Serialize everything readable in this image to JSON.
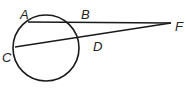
{
  "figure": {
    "type": "secant-secant geometry figure",
    "circle": {
      "cx": 46,
      "cy": 48,
      "r": 33
    },
    "points": {
      "A": {
        "label": "A",
        "x": 28,
        "y": 21
      },
      "B": {
        "label": "B",
        "x": 82,
        "y": 21
      },
      "C": {
        "label": "C",
        "x": 14,
        "y": 48
      },
      "D": {
        "label": "D",
        "x": 90,
        "y": 38
      },
      "F": {
        "label": "F",
        "x": 171,
        "y": 23
      }
    },
    "segments": [
      {
        "from": "A",
        "to": "F"
      },
      {
        "from": "C",
        "to": "F"
      }
    ],
    "stroke_color": "#1a1a1a"
  }
}
